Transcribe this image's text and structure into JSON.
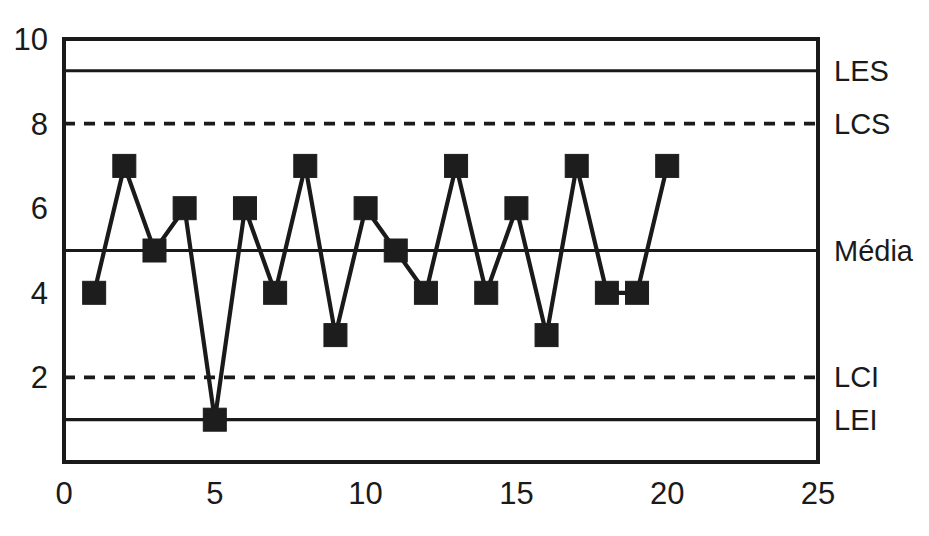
{
  "chart_data": {
    "type": "line",
    "title": "",
    "subtitle": "",
    "xlabel": "",
    "ylabel": "",
    "xlim": [
      0,
      25
    ],
    "ylim": [
      0,
      10
    ],
    "grid": false,
    "legend_position": "right",
    "x_ticks": [
      "0",
      "5",
      "10",
      "15",
      "20",
      "25"
    ],
    "x_tick_values": [
      0,
      5,
      10,
      15,
      20,
      25
    ],
    "y_ticks": [
      "2",
      "4",
      "6",
      "8",
      "10"
    ],
    "y_tick_values": [
      2,
      4,
      6,
      8,
      10
    ],
    "series": [
      {
        "name": "medicoes",
        "marker": "filled-square",
        "x": [
          1,
          2,
          3,
          4,
          5,
          6,
          7,
          8,
          9,
          10,
          11,
          12,
          13,
          14,
          15,
          16,
          17,
          18,
          19,
          20
        ],
        "values": [
          4,
          7,
          5,
          6,
          1,
          6,
          4,
          7,
          3,
          6,
          5,
          4,
          7,
          4,
          6,
          3,
          7,
          4,
          4,
          7
        ]
      }
    ],
    "reference_lines": [
      {
        "id": "les",
        "label": "LES",
        "value": 9.25,
        "style": "solid"
      },
      {
        "id": "lcs",
        "label": "LCS",
        "value": 8,
        "style": "dashed"
      },
      {
        "id": "media",
        "label": "Média",
        "value": 5,
        "style": "solid"
      },
      {
        "id": "lci",
        "label": "LCI",
        "value": 2,
        "style": "dashed"
      },
      {
        "id": "lei",
        "label": "LEI",
        "value": 1,
        "style": "solid"
      }
    ],
    "colors": {
      "line": "#1a1a1a",
      "marker": "#1d1d1d",
      "axis": "#1a1a1a",
      "background": "#ffffff"
    }
  }
}
